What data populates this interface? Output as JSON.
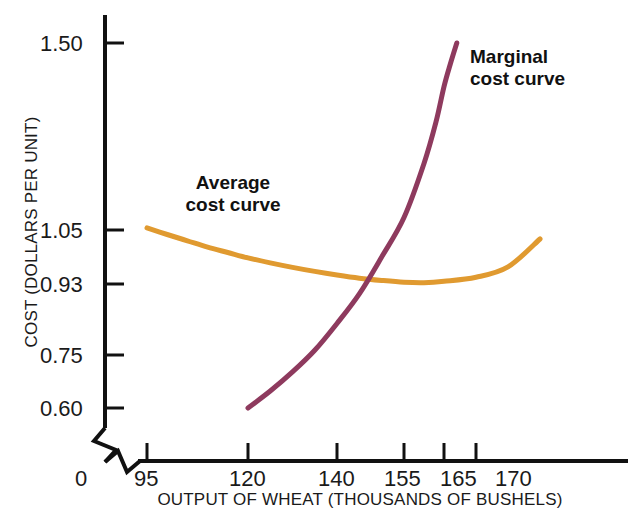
{
  "figure": {
    "background_color": "#ffffff",
    "axis_color": "#111111"
  },
  "axes": {
    "y_title": "COST (DOLLARS PER UNIT)",
    "x_title": "OUTPUT OF WHEAT (THOUSANDS OF BUSHELS)",
    "origin_label": "0",
    "y_ticks": [
      {
        "label": "1.50",
        "value": 1.5,
        "y_px": 43
      },
      {
        "label": "1.05",
        "value": 1.05,
        "y_px": 230
      },
      {
        "label": "0.93",
        "value": 0.93,
        "y_px": 284
      },
      {
        "label": "0.75",
        "value": 0.75,
        "y_px": 355
      },
      {
        "label": "0.60",
        "value": 0.6,
        "y_px": 408
      }
    ],
    "x_ticks": [
      {
        "label": "95",
        "value": 95,
        "x_px": 147
      },
      {
        "label": "120",
        "value": 120,
        "x_px": 248
      },
      {
        "label": "140",
        "value": 140,
        "x_px": 337
      },
      {
        "label": "155",
        "value": 155,
        "x_px": 404
      },
      {
        "label": "165",
        "value": 165,
        "x_px": 444
      },
      {
        "label": "170",
        "value": 170,
        "x_px": 476
      }
    ],
    "y_axis_break": true,
    "x_axis_break": true
  },
  "annotations": {
    "average": {
      "line1": "Average",
      "line2": "cost curve"
    },
    "marginal": {
      "line1": "Marginal",
      "line2": "cost curve"
    }
  },
  "chart_data": {
    "type": "line",
    "title": "",
    "subtitle": "",
    "xlabel": "OUTPUT OF WHEAT (THOUSANDS OF BUSHELS)",
    "ylabel": "COST (DOLLARS PER UNIT)",
    "xlim": [
      95,
      180
    ],
    "ylim": [
      0.6,
      1.5
    ],
    "grid": false,
    "legend_position": "inline-annotation",
    "x_tick_labels": [
      "0",
      "95",
      "120",
      "140",
      "155",
      "165",
      "170"
    ],
    "y_tick_labels": [
      "0.60",
      "0.75",
      "0.93",
      "1.05",
      "1.50"
    ],
    "axis_breaks": {
      "x": true,
      "y": true
    },
    "annotations": [
      {
        "text": "Average cost curve",
        "target_series": "Average cost curve",
        "x": 118,
        "y": 1.17
      },
      {
        "text": "Marginal cost curve",
        "target_series": "Marginal cost curve",
        "x": 172,
        "y": 1.42
      }
    ],
    "intersection": {
      "x": 153,
      "y": 0.935,
      "note": "marginal cost crosses average cost near its minimum"
    },
    "series": [
      {
        "name": "Average cost curve",
        "color": "#E09A30",
        "x": [
          95,
          100,
          105,
          110,
          115,
          120,
          125,
          130,
          135,
          140,
          145,
          150,
          155,
          160,
          165,
          170,
          175,
          180
        ],
        "values": [
          1.055,
          1.04,
          1.026,
          1.012,
          1.0,
          0.988,
          0.977,
          0.967,
          0.958,
          0.95,
          0.943,
          0.938,
          0.934,
          0.933,
          0.936,
          0.945,
          0.968,
          1.03
        ]
      },
      {
        "name": "Marginal cost curve",
        "color": "#8E3A5E",
        "x": [
          120,
          125,
          130,
          135,
          140,
          145,
          150,
          155,
          160,
          163,
          165,
          166,
          167
        ],
        "values": [
          0.6,
          0.648,
          0.702,
          0.762,
          0.83,
          0.905,
          0.99,
          1.08,
          1.21,
          1.31,
          1.395,
          1.45,
          1.5
        ]
      }
    ]
  }
}
